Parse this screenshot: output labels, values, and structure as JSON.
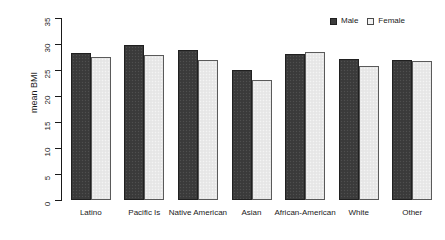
{
  "chart_data": {
    "type": "bar",
    "title": "",
    "subtitle": "",
    "xlabel": "",
    "ylabel": "mean BMI",
    "ylim": [
      0,
      35
    ],
    "yticks": [
      0,
      5,
      10,
      15,
      20,
      25,
      30,
      35
    ],
    "ytick_labels": [
      "0",
      "5",
      "10",
      "15",
      "20",
      "25",
      "30",
      "35"
    ],
    "grid": false,
    "legend_position": "top-right",
    "categories": [
      "Latino",
      "Pacific Is",
      "Native American",
      "Asian",
      "African-American",
      "White",
      "Other"
    ],
    "series": [
      {
        "name": "Male",
        "color": "#3c3c3c",
        "values": [
          28.2,
          29.8,
          28.8,
          25.0,
          28.1,
          27.1,
          27.0
        ]
      },
      {
        "name": "Female",
        "color": "#e9e9e9",
        "values": [
          27.5,
          27.8,
          27.0,
          23.0,
          28.5,
          25.7,
          26.8
        ]
      }
    ]
  },
  "legend": {
    "entries": [
      {
        "label": "Male",
        "swatch": "filled-dark-square"
      },
      {
        "label": "Female",
        "swatch": "open-light-square"
      }
    ]
  }
}
